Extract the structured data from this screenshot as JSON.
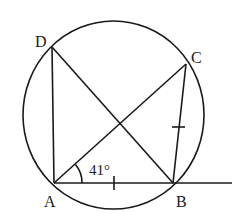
{
  "diagram": {
    "type": "circle-geometry",
    "points": {
      "A": {
        "label": "A",
        "x": 54,
        "y": 183
      },
      "B": {
        "label": "B",
        "x": 173,
        "y": 183
      },
      "C": {
        "label": "C",
        "x": 186,
        "y": 64
      },
      "D": {
        "label": "D",
        "x": 52,
        "y": 47
      }
    },
    "circle": {
      "cx": 113.5,
      "cy": 115,
      "rx": 90.5,
      "ry": 94
    },
    "segments": [
      "AD",
      "AC",
      "DB",
      "BC",
      "AB"
    ],
    "ray": {
      "from": "A",
      "through": "B",
      "to_x": 232
    },
    "angle_label": "41°",
    "equal_marks": [
      "AB",
      "BC"
    ],
    "color": "#1a1a1a"
  }
}
